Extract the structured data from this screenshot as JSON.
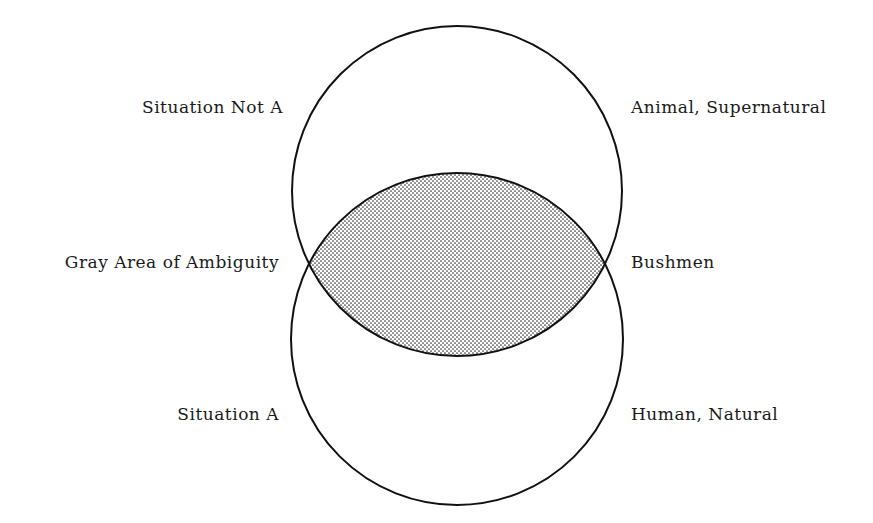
{
  "diagram": {
    "type": "venn",
    "colors": {
      "stroke": "#111111",
      "dots": "#333333",
      "background": "#ffffff"
    },
    "circles": [
      {
        "name": "Situation Not A",
        "cx": 457,
        "cy": 191,
        "r": 165
      },
      {
        "name": "Situation A",
        "cx": 457,
        "cy": 339,
        "r": 166
      }
    ],
    "overlap_label": "Gray Area of Ambiguity"
  },
  "labels": {
    "left": {
      "top": "Situation Not A",
      "middle": "Gray Area of Ambiguity",
      "bottom": "Situation A"
    },
    "right": {
      "top": "Animal, Supernatural",
      "middle": "Bushmen",
      "bottom": "Human, Natural"
    }
  }
}
